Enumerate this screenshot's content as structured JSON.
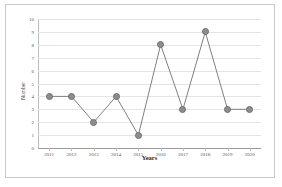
{
  "chart_data": {
    "type": "line",
    "title": "",
    "xlabel": "Years",
    "ylabel": "Number",
    "categories": [
      "2011",
      "2012",
      "2013",
      "2014",
      "2015",
      "2016",
      "2017",
      "2018",
      "2019",
      "2020"
    ],
    "values": [
      4,
      4,
      2,
      4,
      1,
      8,
      3,
      9,
      3,
      3
    ],
    "series": [
      {
        "name": "Number",
        "values": [
          4,
          4,
          2,
          4,
          1,
          8,
          3,
          9,
          3,
          3
        ]
      }
    ],
    "ylim": [
      0,
      10
    ],
    "yticks": [
      "0",
      "1",
      "2",
      "3",
      "4",
      "5",
      "6",
      "7",
      "8",
      "9",
      "10"
    ],
    "grid": true,
    "legend": false,
    "legend_position": "none",
    "marker": "circle",
    "colors": {
      "line": "#808080",
      "marker_fill": "#8d8d8d",
      "marker_edge": "#6f6f6f",
      "gridline": "#e4e4e4",
      "axis": "#9a9a9a",
      "border": "#c9c9c9"
    }
  }
}
